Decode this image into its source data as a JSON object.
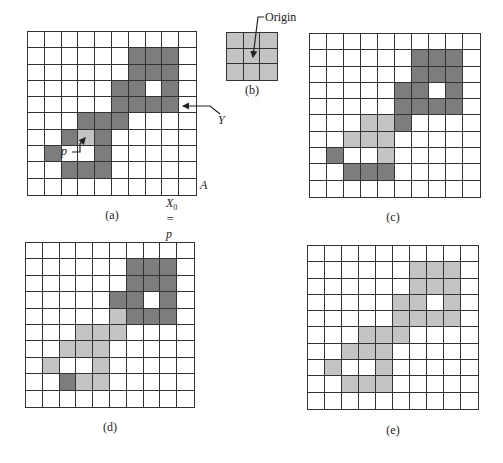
{
  "figure": {
    "panels": [
      {
        "id": "a",
        "caption": "(a)",
        "rows": 10,
        "cols": 10,
        "x": 27,
        "y": 31,
        "w": 170,
        "h": 165,
        "dark": [
          [
            1,
            6
          ],
          [
            1,
            7
          ],
          [
            1,
            8
          ],
          [
            2,
            6
          ],
          [
            2,
            7
          ],
          [
            2,
            8
          ],
          [
            3,
            5
          ],
          [
            3,
            6
          ],
          [
            3,
            8
          ],
          [
            4,
            5
          ],
          [
            4,
            6
          ],
          [
            4,
            7
          ],
          [
            4,
            8
          ],
          [
            5,
            3
          ],
          [
            5,
            4
          ],
          [
            5,
            5
          ],
          [
            6,
            2
          ],
          [
            6,
            4
          ],
          [
            7,
            1
          ],
          [
            7,
            4
          ],
          [
            8,
            2
          ],
          [
            8,
            3
          ],
          [
            8,
            4
          ]
        ],
        "light": [
          [
            6,
            3
          ]
        ]
      },
      {
        "id": "b",
        "caption": "(b)",
        "rows": 3,
        "cols": 3,
        "x": 226,
        "y": 32,
        "w": 52,
        "h": 49,
        "dark": [],
        "light": [
          [
            0,
            0
          ],
          [
            0,
            1
          ],
          [
            0,
            2
          ],
          [
            1,
            0
          ],
          [
            1,
            1
          ],
          [
            1,
            2
          ],
          [
            2,
            0
          ],
          [
            2,
            1
          ],
          [
            2,
            2
          ]
        ]
      },
      {
        "id": "c",
        "caption": "(c)",
        "rows": 10,
        "cols": 10,
        "x": 309,
        "y": 33,
        "w": 172,
        "h": 165,
        "dark": [
          [
            1,
            6
          ],
          [
            1,
            7
          ],
          [
            1,
            8
          ],
          [
            2,
            6
          ],
          [
            2,
            7
          ],
          [
            2,
            8
          ],
          [
            3,
            5
          ],
          [
            3,
            6
          ],
          [
            3,
            8
          ],
          [
            4,
            5
          ],
          [
            4,
            6
          ],
          [
            4,
            7
          ],
          [
            4,
            8
          ],
          [
            5,
            5
          ],
          [
            7,
            1
          ],
          [
            8,
            2
          ],
          [
            8,
            3
          ],
          [
            8,
            4
          ]
        ],
        "light": [
          [
            5,
            3
          ],
          [
            5,
            4
          ],
          [
            6,
            2
          ],
          [
            6,
            3
          ],
          [
            6,
            4
          ],
          [
            7,
            4
          ]
        ]
      },
      {
        "id": "d",
        "caption": "(d)",
        "rows": 10,
        "cols": 10,
        "x": 25,
        "y": 242,
        "w": 170,
        "h": 166,
        "dark": [
          [
            1,
            6
          ],
          [
            1,
            7
          ],
          [
            1,
            8
          ],
          [
            2,
            6
          ],
          [
            2,
            7
          ],
          [
            2,
            8
          ],
          [
            3,
            5
          ],
          [
            3,
            6
          ],
          [
            3,
            8
          ],
          [
            4,
            6
          ],
          [
            4,
            7
          ],
          [
            4,
            8
          ],
          [
            8,
            2
          ]
        ],
        "light": [
          [
            4,
            5
          ],
          [
            5,
            3
          ],
          [
            5,
            4
          ],
          [
            5,
            5
          ],
          [
            6,
            2
          ],
          [
            6,
            3
          ],
          [
            6,
            4
          ],
          [
            7,
            1
          ],
          [
            7,
            4
          ],
          [
            8,
            3
          ],
          [
            8,
            4
          ]
        ]
      },
      {
        "id": "e",
        "caption": "(e)",
        "rows": 10,
        "cols": 10,
        "x": 307,
        "y": 245,
        "w": 172,
        "h": 165,
        "dark": [],
        "light": [
          [
            1,
            6
          ],
          [
            1,
            7
          ],
          [
            1,
            8
          ],
          [
            2,
            6
          ],
          [
            2,
            7
          ],
          [
            2,
            8
          ],
          [
            3,
            5
          ],
          [
            3,
            6
          ],
          [
            3,
            8
          ],
          [
            4,
            5
          ],
          [
            4,
            6
          ],
          [
            4,
            7
          ],
          [
            4,
            8
          ],
          [
            5,
            3
          ],
          [
            5,
            4
          ],
          [
            5,
            5
          ],
          [
            6,
            2
          ],
          [
            6,
            3
          ],
          [
            6,
            4
          ],
          [
            7,
            1
          ],
          [
            7,
            4
          ],
          [
            8,
            2
          ],
          [
            8,
            3
          ],
          [
            8,
            4
          ]
        ]
      }
    ],
    "labels": {
      "p": "p",
      "Y": "Y",
      "A": "A",
      "X0_p": "X",
      "X0_sub": "0",
      "X0_eq": " = p",
      "origin": "Origin"
    },
    "captions": {
      "a": "(a)",
      "b": "(b)",
      "c": "(c)",
      "d": "(d)",
      "e": "(e)"
    },
    "colors": {
      "dark": "#7d7d7d",
      "light": "#c4c4c4",
      "line": "#333333"
    }
  }
}
